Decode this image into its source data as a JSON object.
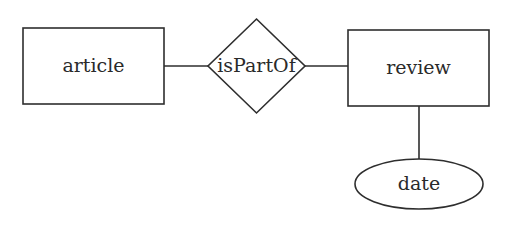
{
  "diagram": {
    "type": "entity-relationship",
    "entities": [
      {
        "id": "article",
        "label": "article",
        "shape": "rectangle"
      },
      {
        "id": "review",
        "label": "review",
        "shape": "rectangle"
      }
    ],
    "relationships": [
      {
        "id": "isPartOf",
        "label": "isPartOf",
        "shape": "diamond",
        "connects": [
          "article",
          "review"
        ]
      }
    ],
    "attributes": [
      {
        "id": "date",
        "label": "date",
        "shape": "ellipse",
        "of": "review"
      }
    ],
    "colors": {
      "stroke": "#2e2e2e",
      "text": "#2a2a2a",
      "background": "#ffffff"
    }
  }
}
